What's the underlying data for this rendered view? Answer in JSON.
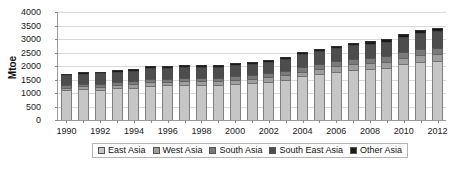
{
  "chart_data": {
    "type": "bar",
    "stacked": true,
    "title": "",
    "xlabel": "",
    "ylabel": "Mtoe",
    "ylim": [
      0,
      4000
    ],
    "yticks": [
      0,
      500,
      1000,
      1500,
      2000,
      2500,
      3000,
      3500,
      4000
    ],
    "ytick_labels": [
      "0",
      "500",
      "1000",
      "1500",
      "2000",
      "2500",
      "3000",
      "3500",
      "4000"
    ],
    "grid": true,
    "legend_position": "bottom",
    "categories": [
      1990,
      1991,
      1992,
      1993,
      1994,
      1995,
      1996,
      1997,
      1998,
      1999,
      2000,
      2001,
      2002,
      2003,
      2004,
      2005,
      2006,
      2007,
      2008,
      2009,
      2010,
      2011,
      2012
    ],
    "xtick_labels": [
      "1990",
      "1992",
      "1994",
      "1996",
      "1998",
      "2000",
      "2002",
      "2004",
      "2006",
      "2008",
      "2010",
      "2012"
    ],
    "xtick_values": [
      1990,
      1992,
      1994,
      1996,
      1998,
      2000,
      2002,
      2004,
      2006,
      2008,
      2010,
      2012
    ],
    "series": [
      {
        "name": "East Asia",
        "color": "#c6c6c6",
        "values": [
          1100,
          1140,
          1130,
          1180,
          1200,
          1270,
          1280,
          1300,
          1300,
          1290,
          1340,
          1360,
          1420,
          1490,
          1620,
          1700,
          1790,
          1860,
          1880,
          1940,
          2080,
          2150,
          2190
        ]
      },
      {
        "name": "West Asia",
        "color": "#9e9e9e",
        "values": [
          100,
          105,
          110,
          115,
          120,
          125,
          130,
          135,
          140,
          145,
          150,
          155,
          160,
          165,
          175,
          185,
          195,
          205,
          215,
          220,
          230,
          240,
          250
        ]
      },
      {
        "name": "South Asia",
        "color": "#7a7a7a",
        "values": [
          90,
          95,
          100,
          105,
          110,
          115,
          120,
          125,
          130,
          135,
          140,
          145,
          150,
          155,
          165,
          175,
          185,
          195,
          205,
          210,
          220,
          230,
          240
        ]
      },
      {
        "name": "South East Asia",
        "color": "#4d4d4d",
        "values": [
          380,
          380,
          390,
          390,
          400,
          410,
          400,
          400,
          390,
          400,
          420,
          410,
          420,
          440,
          470,
          480,
          480,
          510,
          520,
          530,
          560,
          600,
          620
        ]
      },
      {
        "name": "Other Asia",
        "color": "#1a1a1a",
        "values": [
          50,
          55,
          55,
          60,
          60,
          65,
          65,
          65,
          65,
          65,
          70,
          70,
          75,
          75,
          80,
          85,
          85,
          90,
          95,
          95,
          100,
          105,
          110
        ]
      }
    ],
    "totals": [
      1720,
      1775,
      1785,
      1850,
      1890,
      1985,
      1995,
      2025,
      2025,
      2035,
      2120,
      2140,
      2225,
      2325,
      2510,
      2625,
      2735,
      2860,
      2915,
      2995,
      3190,
      3325,
      3410
    ]
  },
  "legend": {
    "items": [
      {
        "label": "East Asia"
      },
      {
        "label": "West Asia"
      },
      {
        "label": "South Asia"
      },
      {
        "label": "South East Asia"
      },
      {
        "label": "Other Asia"
      }
    ]
  }
}
